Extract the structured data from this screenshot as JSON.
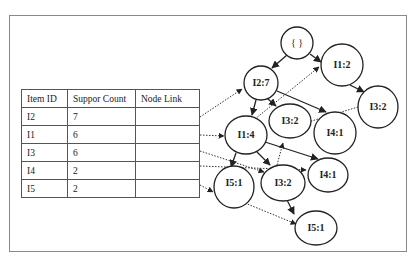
{
  "header_table": {
    "columns": [
      "Item ID",
      "Suppor Count",
      "Node Link"
    ],
    "rows": [
      {
        "item": "I2",
        "count": "7",
        "link": ""
      },
      {
        "item": "I1",
        "count": "6",
        "link": ""
      },
      {
        "item": "I3",
        "count": "6",
        "link": ""
      },
      {
        "item": "I4",
        "count": "2",
        "link": ""
      },
      {
        "item": "I5",
        "count": "2",
        "link": ""
      }
    ]
  },
  "tree": {
    "nodes": {
      "root": "{ }",
      "i2_7": "I2:7",
      "i1_2": "I1:2",
      "i3_2_right": "I3:2",
      "i1_4": "I1:4",
      "i3_2_upper": "I3:2",
      "i4_1_upper": "I4:1",
      "i5_1_left": "I5:1",
      "i3_2_lower": "I3:2",
      "i4_1_lower": "I4:1",
      "i5_1_lower": "I5:1"
    }
  },
  "colors": {
    "line": "#222222",
    "frame": "#8a8a8a",
    "table_border": "#555555"
  }
}
